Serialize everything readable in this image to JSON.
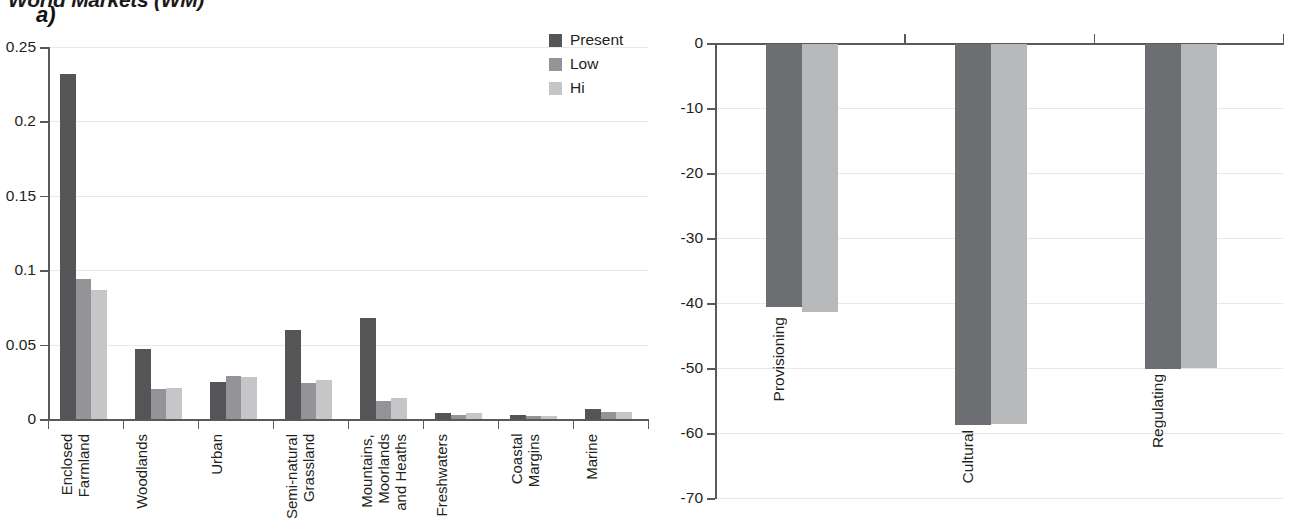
{
  "figure": {
    "title": "World Markets (WM)"
  },
  "panels": {
    "a": {
      "letter": "a)",
      "legend": [
        {
          "label": "Present",
          "color": "#555558"
        },
        {
          "label": "Low",
          "color": "#949498"
        },
        {
          "label": "Hi",
          "color": "#c6c6c8"
        }
      ],
      "y_ticks": [
        "0",
        "0.05",
        "0.1",
        "0.15",
        "0.2",
        "0.25"
      ]
    },
    "b": {
      "letter": "b)",
      "legend": [
        {
          "label": "Low",
          "color": "#6d6e71"
        },
        {
          "label": "Hi",
          "color": "#b8b9bb"
        }
      ],
      "y_ticks": [
        "0",
        "-10",
        "-20",
        "-30",
        "-40",
        "-50",
        "-60",
        "-70"
      ]
    }
  },
  "chart_data": [
    {
      "type": "bar",
      "panel": "a)",
      "title": "World Markets (WM)",
      "xlabel": "",
      "ylabel": "",
      "ylim": [
        0,
        0.25
      ],
      "yticks": [
        0,
        0.05,
        0.1,
        0.15,
        0.2,
        0.25
      ],
      "grid": true,
      "legend_position": "top-right",
      "categories": [
        "Enclosed\nFarmland",
        "Woodlands",
        "Urban",
        "Semi-natural\nGrassland",
        "Mountains,\nMoorlands\nand Heaths",
        "Freshwaters",
        "Coastal\nMargins",
        "Marine"
      ],
      "series": [
        {
          "name": "Present",
          "color": "#555558",
          "values": [
            0.232,
            0.047,
            0.025,
            0.06,
            0.068,
            0.004,
            0.003,
            0.007
          ]
        },
        {
          "name": "Low",
          "color": "#949498",
          "values": [
            0.094,
            0.02,
            0.029,
            0.024,
            0.012,
            0.003,
            0.002,
            0.005
          ]
        },
        {
          "name": "Hi",
          "color": "#c6c6c8",
          "values": [
            0.087,
            0.021,
            0.028,
            0.026,
            0.014,
            0.004,
            0.002,
            0.005
          ]
        }
      ]
    },
    {
      "type": "bar",
      "panel": "b)",
      "title": "",
      "xlabel": "",
      "ylabel": "",
      "ylim": [
        -70,
        0
      ],
      "yticks": [
        0,
        -10,
        -20,
        -30,
        -40,
        -50,
        -60,
        -70
      ],
      "grid": true,
      "legend_position": "bottom-left",
      "categories": [
        "Provisioning",
        "Cultural",
        "Regulating"
      ],
      "series": [
        {
          "name": "Low",
          "color": "#6d6e71",
          "values": [
            -40.5,
            -58.6,
            -50.0
          ]
        },
        {
          "name": "Hi",
          "color": "#b8b9bb",
          "values": [
            -41.3,
            -58.4,
            -49.9
          ]
        }
      ]
    }
  ]
}
